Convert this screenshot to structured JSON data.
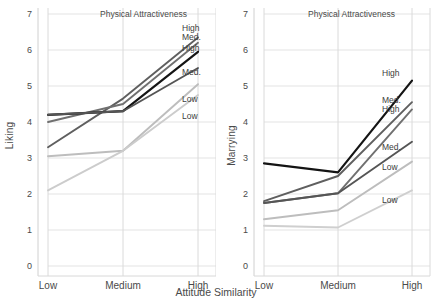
{
  "figure": {
    "xaxis_title": "Attitude Similarity",
    "panel_title": "Physical Attractiveness"
  },
  "panels": [
    {
      "id": "liking",
      "ylabel": "Liking",
      "title": "Physical Attractiveness",
      "yticks": [
        "0",
        "1",
        "2",
        "3",
        "4",
        "5",
        "6",
        "7"
      ],
      "xticks": [
        "Low",
        "Medium",
        "High"
      ],
      "series_labels": [
        "High",
        "Med.",
        "High",
        "Med.",
        "Low",
        "Low"
      ]
    },
    {
      "id": "marrying",
      "ylabel": "Marrying",
      "title": "Physical Attractiveness",
      "yticks": [
        "0",
        "1",
        "2",
        "3",
        "4",
        "5",
        "6",
        "7"
      ],
      "xticks": [
        "Low",
        "Medium",
        "High"
      ],
      "series_labels": [
        "High",
        "Med.",
        "High",
        "Med.",
        "Low",
        "Low"
      ]
    }
  ],
  "chart_data": [
    {
      "type": "line",
      "id": "liking",
      "title": "Physical Attractiveness",
      "xlabel": "Attitude Similarity",
      "ylabel": "Liking",
      "categories": [
        "Low",
        "Medium",
        "High"
      ],
      "ylim": [
        0,
        7
      ],
      "yticks": [
        0,
        1,
        2,
        3,
        4,
        5,
        6,
        7
      ],
      "grid": true,
      "legend_position": "right-inside",
      "series": [
        {
          "name": "High",
          "label": "High",
          "color": "#5f5f5f",
          "values": [
            3.3,
            4.65,
            6.35
          ]
        },
        {
          "name": "Med.",
          "label": "Med.",
          "color": "#707070",
          "values": [
            4.0,
            4.5,
            6.2
          ]
        },
        {
          "name": "High2",
          "label": "High",
          "color": "#141414",
          "values": [
            4.2,
            4.3,
            5.95
          ]
        },
        {
          "name": "Med.2",
          "label": "Med.",
          "color": "#555555",
          "values": [
            4.2,
            4.3,
            5.5
          ]
        },
        {
          "name": "Low",
          "label": "Low",
          "color": "#bdbdbd",
          "values": [
            3.05,
            3.2,
            5.05
          ]
        },
        {
          "name": "Low2",
          "label": "Low",
          "color": "#cccccc",
          "values": [
            2.1,
            3.2,
            4.75
          ]
        }
      ]
    },
    {
      "type": "line",
      "id": "marrying",
      "title": "Physical Attractiveness",
      "xlabel": "Attitude Similarity",
      "ylabel": "Marrying",
      "categories": [
        "Low",
        "Medium",
        "High"
      ],
      "ylim": [
        0,
        7
      ],
      "yticks": [
        0,
        1,
        2,
        3,
        4,
        5,
        6,
        7
      ],
      "grid": true,
      "legend_position": "right-inside",
      "series": [
        {
          "name": "High",
          "label": "High",
          "color": "#141414",
          "values": [
            2.85,
            2.6,
            5.15
          ]
        },
        {
          "name": "Med.",
          "label": "Med.",
          "color": "#5f5f5f",
          "values": [
            1.8,
            2.5,
            4.55
          ]
        },
        {
          "name": "High2",
          "label": "High",
          "color": "#707070",
          "values": [
            1.75,
            2.02,
            4.35
          ]
        },
        {
          "name": "Med.2",
          "label": "Med.",
          "color": "#555555",
          "values": [
            1.75,
            2.02,
            3.45
          ]
        },
        {
          "name": "Low",
          "label": "Low",
          "color": "#bdbdbd",
          "values": [
            1.3,
            1.55,
            2.9
          ]
        },
        {
          "name": "Low2",
          "label": "Low",
          "color": "#cfcfcf",
          "values": [
            1.12,
            1.07,
            2.1
          ]
        }
      ]
    }
  ]
}
